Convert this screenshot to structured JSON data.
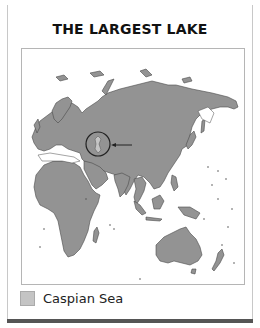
{
  "title": "THE LARGEST LAKE",
  "map": {
    "land_color": "#939393",
    "outline_color": "#444444",
    "highlight": {
      "label": "Caspian Sea",
      "marker": "circle-with-arrow"
    }
  },
  "legend": {
    "items": [
      {
        "label": "Caspian Sea",
        "swatch_color": "#c4c4c4"
      }
    ]
  }
}
